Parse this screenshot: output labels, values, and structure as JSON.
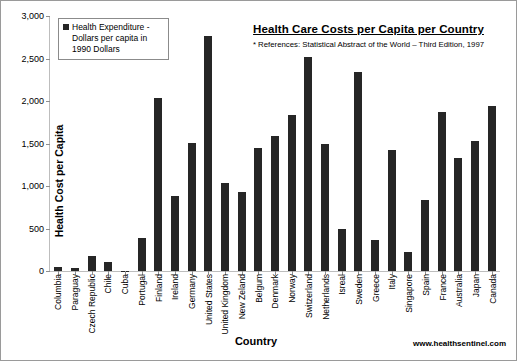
{
  "chart_data": {
    "type": "bar",
    "title": "Health Care Costs per Capita per Country",
    "subtitle": "* References: Statistical Abstract of the World – Third Edition, 1997",
    "xlabel": "Country",
    "ylabel": "Health Cost per Capita",
    "ylim": [
      0,
      3000
    ],
    "ytick_labels": [
      "3,000",
      "2,500",
      "2,000",
      "1,500",
      "1,000",
      "500",
      "0"
    ],
    "ytick_values": [
      3000,
      2500,
      2000,
      1500,
      1000,
      500,
      0
    ],
    "grid": false,
    "legend_position": "top-left",
    "legend": [
      "Health Expenditure - Dollars per capita in 1990 Dollars"
    ],
    "bar_color": "#262626",
    "series": [
      {
        "name": "Health Expenditure - Dollars per capita in 1990 Dollars",
        "values": [
          50,
          40,
          180,
          105,
          5,
          390,
          2040,
          880,
          1510,
          2765,
          1040,
          925,
          1450,
          1585,
          1835,
          2515,
          1500,
          500,
          2340,
          360,
          1420,
          220,
          830,
          1875,
          1335,
          1535,
          1945
        ]
      }
    ],
    "categories": [
      "Columbia",
      "Paraguay",
      "Czech Republic",
      "Chile",
      "Cuba",
      "Portugal",
      "Finland",
      "Ireland",
      "Germany",
      "United States",
      "United Kingdom",
      "New Zeland",
      "Belgum",
      "Denmark",
      "Norway",
      "Switzerland",
      "Netherlands",
      "Isreal",
      "Sweden",
      "Greece",
      "Italy",
      "Singapore",
      "Spain",
      "France",
      "Australia",
      "Japan",
      "Canada"
    ]
  },
  "legend": {
    "line1": "Health Expenditure -",
    "line2": "Dollars per capita in",
    "line3": "1990 Dollars"
  },
  "footer": {
    "url": "www.healthsentinel.com"
  }
}
